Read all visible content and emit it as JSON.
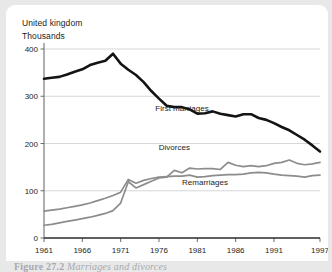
{
  "figure": {
    "caption_number": "Figure 27.2",
    "caption_text": "Marriages and divorces"
  },
  "header": {
    "region": "United kingdom",
    "units": "Thousands"
  },
  "chart_data": {
    "type": "line",
    "title": "United kingdom",
    "subtitle": "Thousands",
    "xlabel": "",
    "ylabel": "Thousands",
    "xlim": [
      1961,
      1997
    ],
    "ylim": [
      0,
      400
    ],
    "yticks": [
      0,
      100,
      200,
      300,
      400
    ],
    "ytick_labels": [
      "0",
      "100",
      "200",
      "300",
      "400"
    ],
    "xticks": [
      1961,
      1966,
      1971,
      1976,
      1981,
      1986,
      1991,
      1997
    ],
    "xtick_labels": [
      "1961",
      "1966",
      "1971",
      "1976",
      "1981",
      "1986",
      "1991",
      "1997"
    ],
    "grid": "horizontal",
    "legend_position": "inline-annotations",
    "x": [
      1961,
      1962,
      1963,
      1964,
      1965,
      1966,
      1967,
      1968,
      1969,
      1970,
      1971,
      1972,
      1973,
      1974,
      1975,
      1976,
      1977,
      1978,
      1979,
      1980,
      1981,
      1982,
      1983,
      1984,
      1985,
      1986,
      1987,
      1988,
      1989,
      1990,
      1991,
      1992,
      1993,
      1994,
      1995,
      1996,
      1997
    ],
    "series": [
      {
        "name": "First marriages",
        "color": "#141414",
        "width": 2.6,
        "label_x": 1979,
        "label_y": 268,
        "values": [
          337,
          339,
          341,
          346,
          352,
          357,
          366,
          371,
          375,
          390,
          369,
          356,
          345,
          330,
          311,
          295,
          280,
          277,
          277,
          272,
          263,
          264,
          268,
          263,
          260,
          257,
          262,
          262,
          254,
          250,
          243,
          235,
          228,
          218,
          208,
          196,
          183
        ]
      },
      {
        "name": "Divorces",
        "color": "#8c8c8c",
        "width": 1.7,
        "label_x": 1978,
        "label_y": 186,
        "values": [
          27,
          29,
          32,
          35,
          38,
          41,
          44,
          48,
          52,
          58,
          74,
          119,
          106,
          113,
          120,
          127,
          129,
          143,
          138,
          148,
          146,
          147,
          147,
          145,
          160,
          154,
          151,
          153,
          151,
          153,
          158,
          160,
          165,
          158,
          155,
          157,
          160
        ]
      },
      {
        "name": "Remarriages",
        "color": "#8c8c8c",
        "width": 1.7,
        "label_x": 1982,
        "label_y": 112,
        "values": [
          57,
          59,
          61,
          64,
          67,
          70,
          74,
          79,
          84,
          90,
          97,
          124,
          116,
          122,
          126,
          129,
          130,
          131,
          131,
          133,
          129,
          130,
          132,
          133,
          134,
          134,
          135,
          138,
          139,
          138,
          135,
          133,
          132,
          131,
          129,
          132,
          133
        ]
      }
    ]
  }
}
